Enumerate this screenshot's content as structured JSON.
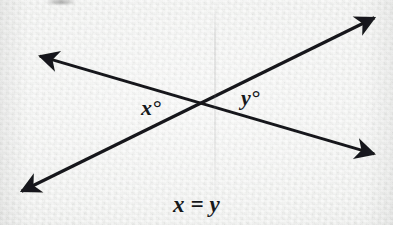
{
  "figure": {
    "caption": "x = y",
    "background_color": "#eef0ee",
    "ink_color": "#16181a",
    "angle_labels": {
      "left": "x°",
      "right": "y°"
    },
    "lines": [
      {
        "name": "falling-line",
        "description": "double-headed arrow from upper-left to lower-right",
        "start": [
          36,
          55
        ],
        "end": [
          378,
          155
        ],
        "arrowheads": [
          "start",
          "end"
        ]
      },
      {
        "name": "rising-line",
        "description": "double-headed arrow from lower-left to upper-right",
        "start": [
          18,
          193
        ],
        "end": [
          378,
          16
        ],
        "arrowheads": [
          "start",
          "end"
        ]
      }
    ],
    "intersection": [
      203,
      107
    ],
    "arrowhead_names": {
      "upper_left": "arrowhead-upper-left",
      "upper_right": "arrowhead-upper-right",
      "lower_left": "arrowhead-lower-left",
      "lower_right": "arrowhead-lower-right"
    }
  }
}
